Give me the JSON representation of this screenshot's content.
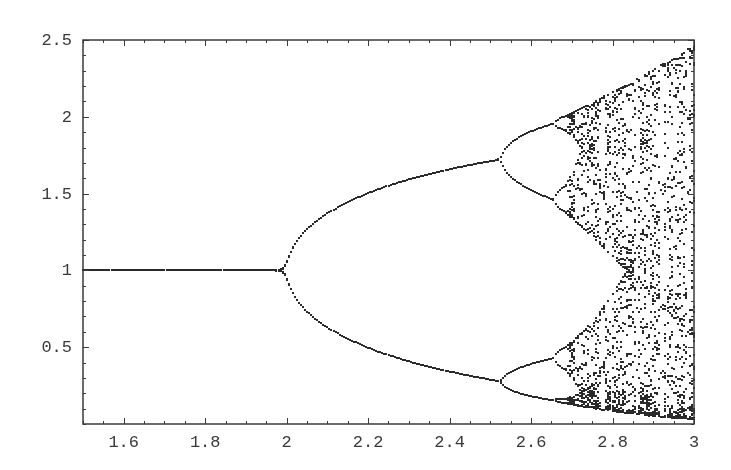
{
  "chart_data": {
    "type": "scatter",
    "title": "",
    "xlabel": "",
    "ylabel": "",
    "map": "x_next = x * exp(r * (1 - x))",
    "xlim": [
      1.5,
      3.0
    ],
    "ylim": [
      0,
      2.5
    ],
    "grid": false,
    "legend": null,
    "x_ticks": [
      1.6,
      1.8,
      2,
      2.2,
      2.4,
      2.6,
      2.8,
      3
    ],
    "x_tick_labels": [
      "1.6",
      "1.8",
      "2",
      "2.2",
      "2.4",
      "2.6",
      "2.8",
      "3"
    ],
    "x_minor_step": 0.05,
    "y_ticks": [
      0.5,
      1,
      1.5,
      2,
      2.5
    ],
    "y_tick_labels": [
      "0.5",
      "1",
      "1.5",
      "2",
      "2.5"
    ],
    "y_minor_step": 0.1,
    "key_points": [
      {
        "r": 1.5,
        "x": [
          1.0
        ],
        "note": "stable fixed point x=1"
      },
      {
        "r": 2.0,
        "x": [
          1.0
        ],
        "note": "first period-doubling bifurcation"
      },
      {
        "r": 2.526,
        "x": [
          0.27,
          1.72
        ],
        "note": "second period-doubling (period 4)"
      },
      {
        "r": 2.66,
        "x": [
          0.17,
          0.43,
          1.45,
          1.95
        ],
        "note": "period 8 onset, then chaos"
      },
      {
        "r": 2.69,
        "x": "chaotic band",
        "note": "onset of chaos"
      },
      {
        "r": 3.0,
        "x": [
          0.02,
          2.46
        ],
        "note": "chaotic band envelope at right edge"
      }
    ],
    "sampling": {
      "r_steps": 300,
      "transient": 200,
      "plotted_iterations": 40
    }
  },
  "plot_area": {
    "left": 83,
    "top": 40,
    "right": 694,
    "bottom": 424
  },
  "colors": {
    "points": "#2a2a2a",
    "axes": "#3a3a3a",
    "background": "#ffffff"
  }
}
